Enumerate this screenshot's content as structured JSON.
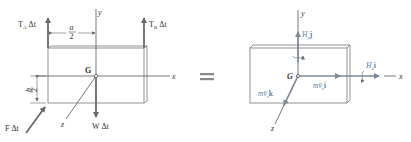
{
  "figure": {
    "left_panel": {
      "axes": {
        "x": "x",
        "y": "y",
        "z": "z"
      },
      "center_label": "G",
      "forces": {
        "tension_a": {
          "main": "T",
          "sub": "A",
          "suffix": " Δt"
        },
        "tension_b": {
          "main": "T",
          "sub": "B",
          "suffix": " Δt"
        },
        "weight": {
          "main": "W Δt"
        },
        "impulse": {
          "main": "F Δt"
        }
      },
      "dimensions": {
        "half_width": {
          "num": "a",
          "den": "2"
        },
        "half_height": {
          "num": "b",
          "den": "2"
        }
      }
    },
    "equals_sign": "=",
    "right_panel": {
      "axes": {
        "x": "x",
        "y": "y",
        "z": "z"
      },
      "center_label": "G",
      "vectors": {
        "angular_momentum_y": {
          "main": "H",
          "sub": "y",
          "suffix": "j"
        },
        "angular_momentum_x": {
          "main": "H",
          "sub": "x",
          "suffix": "i"
        },
        "linear_momentum_x": {
          "main": "mv̄",
          "sub": "x",
          "suffix": "i"
        },
        "linear_momentum_z": {
          "main": "mv̄",
          "sub": "z",
          "suffix": "k"
        }
      }
    }
  },
  "colors": {
    "line": "#555555",
    "force": "#6a6a6a",
    "vector": "#7d8a99",
    "vector_label": "#5a7fb0"
  }
}
